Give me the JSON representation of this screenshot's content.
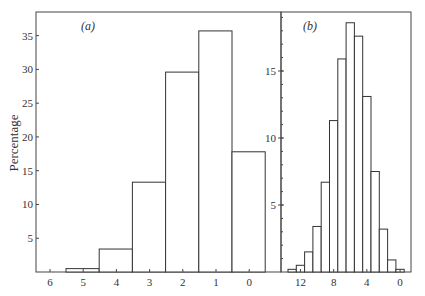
{
  "chart_data": [
    {
      "type": "bar",
      "panel_label": "(a)",
      "ylabel": "Percentage",
      "xlabel": "",
      "categories": [
        "5",
        "4",
        "3",
        "2",
        "1",
        "0"
      ],
      "values": [
        0.5,
        3.4,
        13.3,
        29.6,
        35.7,
        17.8
      ],
      "x_tick_labels": [
        "6",
        "5",
        "4",
        "3",
        "2",
        "1",
        "0"
      ],
      "y_tick_labels": [
        "5",
        "10",
        "15",
        "20",
        "25",
        "30",
        "35"
      ],
      "ylim": [
        0,
        38.5
      ],
      "grid": false
    },
    {
      "type": "bar",
      "panel_label": "(b)",
      "ylabel": "",
      "xlabel": "",
      "categories": [
        "13",
        "12",
        "11",
        "10",
        "9",
        "8",
        "7",
        "6",
        "5",
        "4",
        "3",
        "2",
        "1",
        "0"
      ],
      "values": [
        0.2,
        0.5,
        1.5,
        3.4,
        6.7,
        11.3,
        15.9,
        18.6,
        17.6,
        13.1,
        7.5,
        3.2,
        0.9,
        0.2
      ],
      "x_tick_labels": [
        "12",
        "8",
        "4",
        "0"
      ],
      "y_tick_labels": [
        "5",
        "10",
        "15"
      ],
      "ylim": [
        0,
        19.4
      ],
      "grid": false
    }
  ]
}
